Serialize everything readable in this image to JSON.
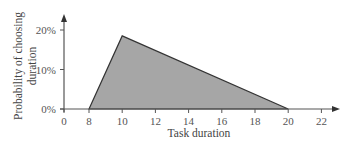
{
  "chart_data": {
    "type": "area",
    "title": "",
    "xlabel": "Task duration",
    "ylabel": "Probability of choosing duration",
    "ylabel_lines": [
      "Probability of choosing",
      "duration"
    ],
    "x": [
      8,
      10,
      20
    ],
    "values": [
      0,
      18.5,
      0
    ],
    "value_unit": "%",
    "xlim": [
      0,
      22
    ],
    "ylim": [
      0,
      20
    ],
    "x_ticks": [
      0,
      8,
      10,
      12,
      14,
      16,
      18,
      20,
      22
    ],
    "x_tick_labels": [
      "0",
      "8",
      "10",
      "12",
      "14",
      "16",
      "18",
      "20",
      "22"
    ],
    "y_ticks": [
      0,
      10,
      20
    ],
    "y_tick_labels": [
      "0%",
      "10%",
      "20%"
    ],
    "grid": false,
    "legend": null,
    "colors": {
      "fill": "#a6a6a6",
      "stroke": "#333333",
      "axis": "#555555"
    }
  }
}
